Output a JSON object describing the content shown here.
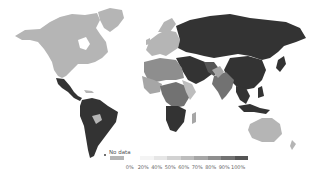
{
  "map": {
    "type": "choropleth",
    "projection": "world",
    "palette": {
      "no_data": "#b5b5b5",
      "c0": "#f4f4f4",
      "c20": "#e6e6e6",
      "c40": "#d2d2d2",
      "c50": "#bdbdbd",
      "c60": "#a6a6a6",
      "c70": "#8e8e8e",
      "c80": "#727272",
      "c90": "#555555",
      "c100": "#333333"
    },
    "regions": [
      {
        "name": "North America (Canada/USA)",
        "bin": "no_data"
      },
      {
        "name": "Greenland",
        "bin": "no_data"
      },
      {
        "name": "Mexico",
        "bin": "100%"
      },
      {
        "name": "Central America",
        "bin": "100%"
      },
      {
        "name": "South America",
        "bin": "100%"
      },
      {
        "name": "Bolivia",
        "bin": "no_data"
      },
      {
        "name": "Europe",
        "bin": "no_data"
      },
      {
        "name": "Russia",
        "bin": "100%"
      },
      {
        "name": "Central Asia",
        "bin": "100%"
      },
      {
        "name": "China",
        "bin": "100%"
      },
      {
        "name": "Middle East",
        "bin": "100%"
      },
      {
        "name": "India",
        "bin": "80%"
      },
      {
        "name": "Southeast Asia",
        "bin": "100%"
      },
      {
        "name": "Indonesia",
        "bin": "100%"
      },
      {
        "name": "Australia",
        "bin": "no_data"
      },
      {
        "name": "Africa",
        "bin": "mixed"
      },
      {
        "name": "Southern Africa",
        "bin": "100%"
      }
    ]
  },
  "legend": {
    "no_data_label": "No data",
    "ticks": [
      "0%",
      "20%",
      "40%",
      "50%",
      "60%",
      "70%",
      "80%",
      "90%",
      "100%"
    ],
    "swatches": [
      "#f4f4f4",
      "#e6e6e6",
      "#d2d2d2",
      "#bdbdbd",
      "#a6a6a6",
      "#8e8e8e",
      "#727272",
      "#555555",
      "#333333"
    ]
  }
}
